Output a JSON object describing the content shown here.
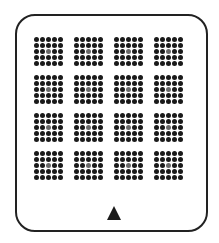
{
  "panel": {
    "rows": 4,
    "cols": 4,
    "dots_per_side": 5,
    "dot_color": "#1a1a1a",
    "center_dot_color": "#6a6a6a",
    "frame_color": "#222222"
  },
  "controls": {
    "up_arrow": "up-triangle"
  }
}
